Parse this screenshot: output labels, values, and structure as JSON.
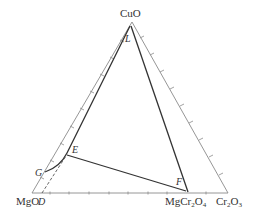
{
  "diagram": {
    "type": "ternary-phase-diagram",
    "vertices": {
      "top": "CuO",
      "bottom_left": "MgO",
      "bottom_right": "Cr2O3"
    },
    "vertex_labels": {
      "top": {
        "text": "CuO"
      },
      "bottom_left": {
        "text": "MgO"
      },
      "bottom_right_main": "Cr",
      "bottom_right_sub1": "2",
      "bottom_right_mid": "O",
      "bottom_right_sub2": "3"
    },
    "compound_label": {
      "main": "MgCr",
      "sub1": "2",
      "mid": "O",
      "sub2": "4"
    },
    "points": {
      "L": "L",
      "E": "E",
      "F": "F",
      "G": "G",
      "D": "D"
    },
    "colors": {
      "triangle": "#888888",
      "phase_lines": "#333333",
      "ticks": "#888888",
      "dashed": "#555555"
    }
  }
}
